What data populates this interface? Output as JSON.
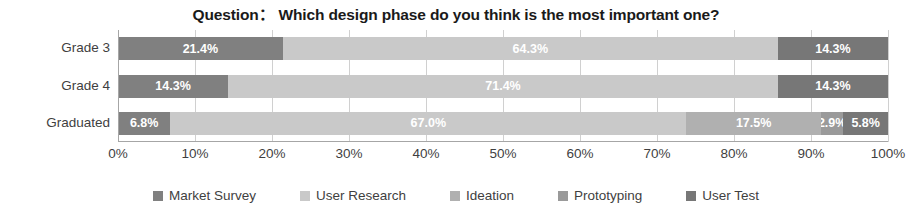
{
  "chart_data": {
    "type": "bar",
    "orientation": "horizontal",
    "stacked": true,
    "stack_mode": "percent",
    "title": "Question： Which design phase do you think is the most important one?",
    "xlabel": "",
    "ylabel": "",
    "xlim": [
      0,
      100
    ],
    "xticks": [
      "0%",
      "10%",
      "20%",
      "30%",
      "40%",
      "50%",
      "60%",
      "70%",
      "80%",
      "90%",
      "100%"
    ],
    "xtick_values": [
      0,
      10,
      20,
      30,
      40,
      50,
      60,
      70,
      80,
      90,
      100
    ],
    "grid": true,
    "grid_axis": "x",
    "legend_position": "bottom",
    "categories": [
      "Grade 3",
      "Grade 4",
      "Graduated"
    ],
    "series": [
      {
        "name": "Market Survey",
        "color": "#808080",
        "values": [
          21.4,
          14.3,
          6.8
        ],
        "labels": [
          "21.4%",
          "14.3%",
          "6.8%"
        ]
      },
      {
        "name": "User Research",
        "color": "#c9c9c9",
        "values": [
          64.3,
          71.4,
          67.0
        ],
        "labels": [
          "64.3%",
          "71.4%",
          "67.0%"
        ]
      },
      {
        "name": "Ideation",
        "color": "#b0b0b0",
        "values": [
          0.0,
          0.0,
          17.5
        ],
        "labels": [
          "",
          "",
          "17.5%"
        ]
      },
      {
        "name": "Prototyping",
        "color": "#9a9a9a",
        "values": [
          0.0,
          0.0,
          2.9
        ],
        "labels": [
          "",
          "",
          "2.9%"
        ]
      },
      {
        "name": "User Test",
        "color": "#777777",
        "values": [
          14.3,
          14.3,
          5.8
        ],
        "labels": [
          "14.3%",
          "14.3%",
          "5.8%"
        ]
      }
    ]
  },
  "legend": {
    "items": [
      {
        "label": "Market Survey",
        "color": "#808080"
      },
      {
        "label": "User Research",
        "color": "#c9c9c9"
      },
      {
        "label": "Ideation",
        "color": "#b0b0b0"
      },
      {
        "label": "Prototyping",
        "color": "#9a9a9a"
      },
      {
        "label": "User Test",
        "color": "#777777"
      }
    ]
  }
}
